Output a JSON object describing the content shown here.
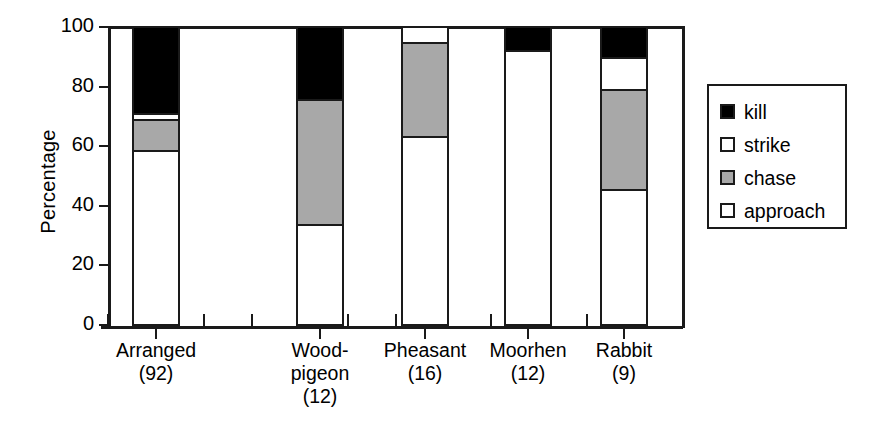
{
  "chart_data": {
    "type": "bar",
    "subtype": "stacked-percentage",
    "title": "",
    "xlabel": "",
    "ylabel": "Percentage",
    "ylim": [
      0,
      100
    ],
    "yticks": [
      0,
      20,
      40,
      60,
      80,
      100
    ],
    "ytick_labels": [
      "0",
      "20",
      "40",
      "60",
      "80",
      "100"
    ],
    "grid": false,
    "legend_position": "right-outside",
    "categories": [
      "Arranged",
      "Wood-\npigeon",
      "Pheasant",
      "Moorhen",
      "Rabbit"
    ],
    "category_names": [
      "Arranged",
      "Wood-pigeon",
      "Pheasant",
      "Moorhen",
      "Rabbit"
    ],
    "sample_sizes": [
      "(92)",
      "(12)",
      "(16)",
      "(12)",
      "(9)"
    ],
    "sample_counts": [
      92,
      12,
      16,
      12,
      9
    ],
    "series": [
      {
        "name": "approach",
        "color": "#ffffff",
        "values": [
          58.4,
          33.5,
          63.0,
          92.0,
          45.3
        ]
      },
      {
        "name": "chase",
        "color": "#a8a8a8",
        "values": [
          10.5,
          42.0,
          31.5,
          0.0,
          33.7
        ]
      },
      {
        "name": "strike",
        "color": "#ffffff",
        "values": [
          2.0,
          0.0,
          5.5,
          0.0,
          10.7
        ]
      },
      {
        "name": "kill",
        "color": "#000000",
        "values": [
          29.1,
          24.5,
          0.0,
          8.0,
          10.3
        ]
      }
    ],
    "cumulative_tops": {
      "approach": [
        58.4,
        33.5,
        63.0,
        92.0,
        45.3
      ],
      "chase": [
        68.9,
        75.5,
        94.5,
        92.0,
        79.0
      ],
      "strike": [
        70.9,
        75.5,
        100.0,
        92.0,
        89.7
      ],
      "kill": [
        100.0,
        100.0,
        100.0,
        100.0,
        100.0
      ]
    }
  },
  "axis": {
    "y_title": "Percentage",
    "y_tick_labels": [
      "100",
      "80",
      "60",
      "40",
      "20",
      "0"
    ]
  },
  "legend": {
    "items": [
      {
        "label": "kill",
        "swatch": "black"
      },
      {
        "label": "strike",
        "swatch": "white"
      },
      {
        "label": "chase",
        "swatch": "gray"
      },
      {
        "label": "approach",
        "swatch": "white"
      }
    ]
  },
  "x_categories": [
    {
      "line1": "Arranged",
      "line2": "(92)",
      "line3": ""
    },
    {
      "line1": "Wood-",
      "line2": "pigeon",
      "line3": "(12)"
    },
    {
      "line1": "Pheasant",
      "line2": "(16)",
      "line3": ""
    },
    {
      "line1": "Moorhen",
      "line2": "(12)",
      "line3": ""
    },
    {
      "line1": "Rabbit",
      "line2": "(9)",
      "line3": ""
    }
  ],
  "colors": {
    "kill": "#000000",
    "strike": "#ffffff",
    "chase": "#a8a8a8",
    "approach": "#ffffff",
    "axis": "#1a1a1a",
    "background": "#ffffff"
  }
}
